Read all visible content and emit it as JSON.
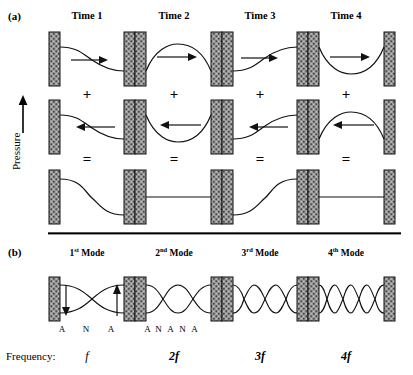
{
  "figure": {
    "panel_a": {
      "label": "(a)",
      "column_titles": [
        "Time 1",
        "Time 2",
        "Time 3",
        "Time 4"
      ],
      "operator_plus": "+",
      "operator_equals": "=",
      "axis_label": "Pressure",
      "axis_arrow_icon": "up-arrow-icon",
      "rows": [
        {
          "name": "rightward-travelling-wave",
          "direction_icon": "right-arrow-icon",
          "waves": [
            {
              "time": "Time 1",
              "shape": "descending-ramp",
              "phase_deg": 0
            },
            {
              "time": "Time 2",
              "shape": "crest-hump",
              "phase_deg": 90
            },
            {
              "time": "Time 3",
              "shape": "ascending-ramp",
              "phase_deg": 180
            },
            {
              "time": "Time 4",
              "shape": "trough-dip",
              "phase_deg": 270
            }
          ]
        },
        {
          "name": "leftward-travelling-wave",
          "direction_icon": "left-arrow-icon",
          "waves": [
            {
              "time": "Time 1",
              "shape": "descending-ramp",
              "phase_deg": 0
            },
            {
              "time": "Time 2",
              "shape": "trough-dip",
              "phase_deg": 270
            },
            {
              "time": "Time 3",
              "shape": "ascending-ramp",
              "phase_deg": 180
            },
            {
              "time": "Time 4",
              "shape": "crest-hump",
              "phase_deg": 90
            }
          ]
        },
        {
          "name": "superposition-standing-wave",
          "direction_icon": "none",
          "waves": [
            {
              "time": "Time 1",
              "shape": "descending-s-curve",
              "amplitude": "full-negative"
            },
            {
              "time": "Time 2",
              "shape": "flat-line",
              "amplitude": "zero"
            },
            {
              "time": "Time 3",
              "shape": "ascending-s-curve",
              "amplitude": "full-positive"
            },
            {
              "time": "Time 4",
              "shape": "flat-line",
              "amplitude": "zero"
            }
          ]
        }
      ]
    },
    "panel_b": {
      "label": "(b)",
      "mode_titles": [
        {
          "ordinal": "1",
          "suffix": "st",
          "word": "Mode"
        },
        {
          "ordinal": "2",
          "suffix": "nd",
          "word": "Mode"
        },
        {
          "ordinal": "3",
          "suffix": "rd",
          "word": "Mode"
        },
        {
          "ordinal": "4",
          "suffix": "th",
          "word": "Mode"
        }
      ],
      "modes": [
        {
          "name": "1st-mode",
          "lobes": 1,
          "node_antinode_labels": [
            "A",
            "N",
            "A"
          ],
          "has_motion_arrows": true
        },
        {
          "name": "2nd-mode",
          "lobes": 2,
          "node_antinode_labels": [
            "A",
            "N",
            "A",
            "N",
            "A"
          ],
          "has_motion_arrows": false
        },
        {
          "name": "3rd-mode",
          "lobes": 3,
          "node_antinode_labels": [],
          "has_motion_arrows": false
        },
        {
          "name": "4th-mode",
          "lobes": 4,
          "node_antinode_labels": [],
          "has_motion_arrows": false
        }
      ],
      "frequency_row_label": "Frequency:",
      "frequency_values": [
        "f",
        "2f",
        "3f",
        "4f"
      ]
    }
  },
  "colors": {
    "wall_fill": "#8d8d8d",
    "wall_stroke": "#1a1a1a",
    "wave_stroke": "#1a1a1a",
    "text": "#000000",
    "divider": "#333333"
  }
}
